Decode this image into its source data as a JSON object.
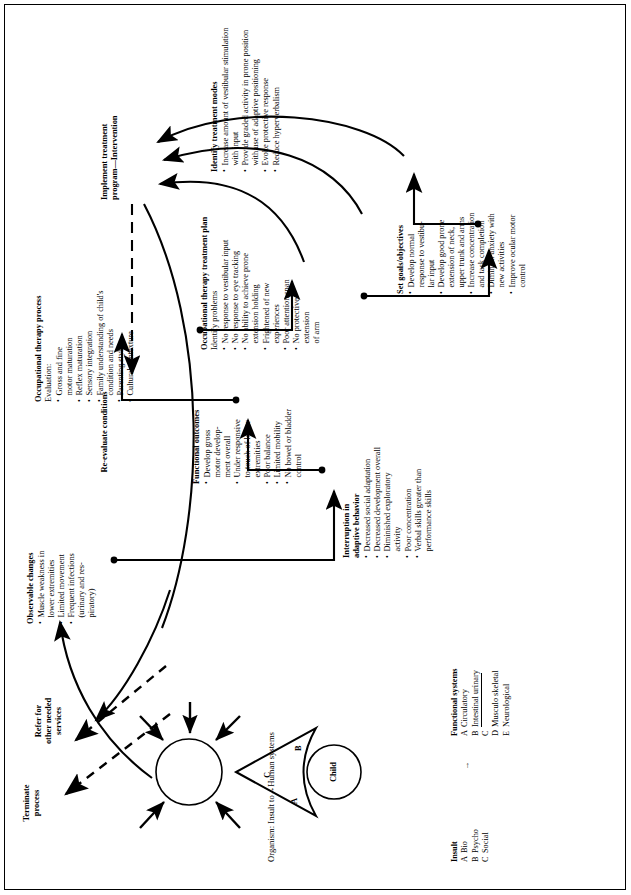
{
  "figure": {
    "organism_caption": "Organism: Insult to→Human systems",
    "child_label": "Child",
    "triangle_labels": [
      "A",
      "B",
      "C"
    ],
    "arrow_symbol": "→"
  },
  "legend": {
    "insult": {
      "title": "Insult",
      "items": [
        {
          "key": "A",
          "label": "Bio"
        },
        {
          "key": "B",
          "label": "Psycho"
        },
        {
          "key": "C",
          "label": "Social"
        }
      ]
    },
    "functional_systems": {
      "title": "Functional systems",
      "items": [
        {
          "key": "A",
          "label": "Circulatory"
        },
        {
          "key": "B",
          "label": "Intestinal urinary"
        },
        {
          "key": "C",
          "label": ""
        },
        {
          "key": "D",
          "label": "Musculo skeletal"
        },
        {
          "key": "E",
          "label": "Neurological"
        }
      ]
    }
  },
  "boxes": {
    "observable_changes": {
      "title": "Observable changes",
      "items": [
        "Muscle weakness in\n   lower extremities",
        "Limited movement",
        "Frequent infections\n(urinary and res-\npiratory)"
      ]
    },
    "interruption": {
      "title": "Interruption in\nadaptive behavior",
      "items": [
        "Decreased social adaptation",
        "Decreased development overall",
        "Diminished exploratory\nactivity",
        "Poor concentration",
        "Verbal skills greater than\nperformance skills"
      ]
    },
    "functional_outcomes": {
      "title": "Functional outcomes",
      "items": [
        "Develop gross\n   motor develop-\n   ment overall",
        "Under responsive\n   to touch of lower\n   extremities",
        "Poor balance",
        "Limited mobility",
        "No bowel or bladder\n   control"
      ]
    },
    "ot_process": {
      "title": "Occupational therapy process",
      "subtitle": "Evaluation:",
      "items": [
        "Gross and fine\n   motor maturation",
        "Reflex maturation",
        "Sensory integration",
        "Family understanding of child's\n   condition and needs",
        "Parenting style",
        "Cultural contexture"
      ]
    },
    "ot_treatment_plan": {
      "title": "Occupational therapy treatment plan",
      "subtitle": "Identify problems",
      "items": [
        "No response to vestibular input",
        "No response to eye tracking",
        "No ability to achieve prone\n   extension holding",
        "Frightened of new\n   experiences",
        "Poor attention span",
        "No protective\n   extension\n   of arm"
      ]
    },
    "set_goals": {
      "title": "Set goals/objectives",
      "items": [
        "Develop normal\n   response to vestibu-\n   lar input",
        "Develop good prone\n   extension of neck,\n   upper trunk and arms",
        "Increase concentration\n   and task completion",
        "Diminish anxiety with\n   new activities",
        "Improve ocular motor\n   control"
      ]
    },
    "treatment_modes": {
      "title": "Identify treatment modes",
      "items": [
        "Increase amount of vestibular stimulation\n   with input",
        "Provide graded activity in prone position\n   with use of adaptive positioning",
        "Evoke protective response",
        "Reduce hyperverbalism"
      ]
    },
    "implement": {
      "title": "Implement treatment\nprogram—Intervention"
    },
    "reevaluate": {
      "title": "Re-evaluate conditions"
    },
    "refer": {
      "title": "Refer for\nother needed\nservices"
    },
    "terminate": {
      "title": "Terminate\nprocess"
    }
  },
  "colors": {
    "ink": "#000000",
    "paper": "#ffffff"
  }
}
